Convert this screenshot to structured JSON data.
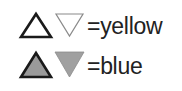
{
  "legend": {
    "rows": [
      {
        "label": "=yellow",
        "symbols": [
          "open-up-triangle",
          "open-down-triangle"
        ],
        "up_fill": "none",
        "down_fill": "none"
      },
      {
        "label": "=blue",
        "symbols": [
          "filled-up-triangle",
          "filled-down-triangle"
        ],
        "up_fill": "#9a9a9a",
        "down_fill": "#a0a0a0"
      }
    ]
  }
}
